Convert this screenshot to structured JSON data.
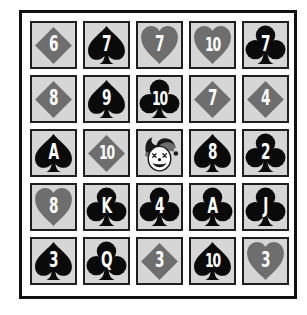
{
  "game": {
    "title": "Card Grid",
    "colors": {
      "card_bg": "#d6d6d6",
      "card_border": "#1e1e1e",
      "red_suit": "#6e6e6e",
      "black_suit": "#0a0a0a",
      "rank_text": "#ffffff",
      "board_border": "#111111"
    },
    "grid": {
      "rows": 5,
      "cols": 5,
      "cards": [
        {
          "rank": "6",
          "suit": "diamond"
        },
        {
          "rank": "7",
          "suit": "spade"
        },
        {
          "rank": "7",
          "suit": "heart"
        },
        {
          "rank": "10",
          "suit": "heart"
        },
        {
          "rank": "7",
          "suit": "club"
        },
        {
          "rank": "8",
          "suit": "diamond"
        },
        {
          "rank": "9",
          "suit": "spade"
        },
        {
          "rank": "10",
          "suit": "club"
        },
        {
          "rank": "7",
          "suit": "diamond"
        },
        {
          "rank": "4",
          "suit": "diamond"
        },
        {
          "rank": "A",
          "suit": "spade"
        },
        {
          "rank": "10",
          "suit": "diamond"
        },
        {
          "rank": "",
          "suit": "joker"
        },
        {
          "rank": "8",
          "suit": "spade"
        },
        {
          "rank": "2",
          "suit": "club"
        },
        {
          "rank": "8",
          "suit": "heart"
        },
        {
          "rank": "K",
          "suit": "club"
        },
        {
          "rank": "4",
          "suit": "club"
        },
        {
          "rank": "A",
          "suit": "club"
        },
        {
          "rank": "J",
          "suit": "club"
        },
        {
          "rank": "3",
          "suit": "spade"
        },
        {
          "rank": "Q",
          "suit": "club"
        },
        {
          "rank": "3",
          "suit": "diamond"
        },
        {
          "rank": "10",
          "suit": "spade"
        },
        {
          "rank": "3",
          "suit": "heart"
        }
      ]
    }
  }
}
